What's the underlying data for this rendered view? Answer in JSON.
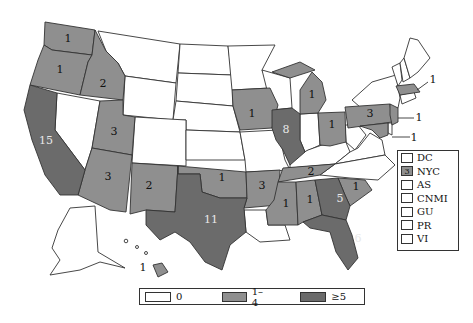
{
  "map": {
    "type": "choropleth",
    "region": "United States",
    "colors": {
      "zero": "#ffffff",
      "one_to_four": "#8f8f8f",
      "five_plus": "#6b6b6b",
      "border": "#333333"
    },
    "states": [
      {
        "id": "WA",
        "value": "1",
        "bin": "1-4"
      },
      {
        "id": "OR",
        "value": "1",
        "bin": "1-4"
      },
      {
        "id": "ID",
        "value": "2",
        "bin": "1-4"
      },
      {
        "id": "CA",
        "value": "15",
        "bin": ">=5"
      },
      {
        "id": "UT",
        "value": "3",
        "bin": "1-4"
      },
      {
        "id": "AZ",
        "value": "3",
        "bin": "1-4"
      },
      {
        "id": "NM",
        "value": "2",
        "bin": "1-4"
      },
      {
        "id": "TX",
        "value": "11",
        "bin": ">=5"
      },
      {
        "id": "OK",
        "value": "1",
        "bin": "1-4"
      },
      {
        "id": "IA",
        "value": "1",
        "bin": "1-4"
      },
      {
        "id": "IL",
        "value": "8",
        "bin": ">=5"
      },
      {
        "id": "MI",
        "value": "1",
        "bin": "1-4"
      },
      {
        "id": "OH",
        "value": "1",
        "bin": "1-4"
      },
      {
        "id": "PA",
        "value": "3",
        "bin": "1-4"
      },
      {
        "id": "MA",
        "value": "1",
        "bin": "1-4"
      },
      {
        "id": "NJ",
        "value": "1",
        "bin": "1-4"
      },
      {
        "id": "MD",
        "value": "1",
        "bin": "1-4"
      },
      {
        "id": "AR",
        "value": "3",
        "bin": "1-4"
      },
      {
        "id": "TN",
        "value": "2",
        "bin": "1-4"
      },
      {
        "id": "MS",
        "value": "1",
        "bin": "1-4"
      },
      {
        "id": "AL",
        "value": "1",
        "bin": "1-4"
      },
      {
        "id": "GA",
        "value": "5",
        "bin": ">=5"
      },
      {
        "id": "SC",
        "value": "1",
        "bin": "1-4"
      },
      {
        "id": "FL",
        "value": "6",
        "bin": ">=5"
      },
      {
        "id": "HI",
        "value": "1",
        "bin": "1-4"
      }
    ],
    "callouts": [
      {
        "state": "MA",
        "label": "1"
      },
      {
        "state": "NJ",
        "label": "1"
      },
      {
        "state": "MD",
        "label": "1"
      }
    ]
  },
  "side_legend": {
    "items": [
      {
        "label": "DC",
        "value": ""
      },
      {
        "label": "NYC",
        "value": "3"
      },
      {
        "label": "AS",
        "value": ""
      },
      {
        "label": "CNMI",
        "value": ""
      },
      {
        "label": "GU",
        "value": ""
      },
      {
        "label": "PR",
        "value": ""
      },
      {
        "label": "VI",
        "value": ""
      }
    ]
  },
  "bottom_legend": {
    "items": [
      {
        "label": "0"
      },
      {
        "label": "1–4"
      },
      {
        "label": "≥5"
      }
    ]
  }
}
